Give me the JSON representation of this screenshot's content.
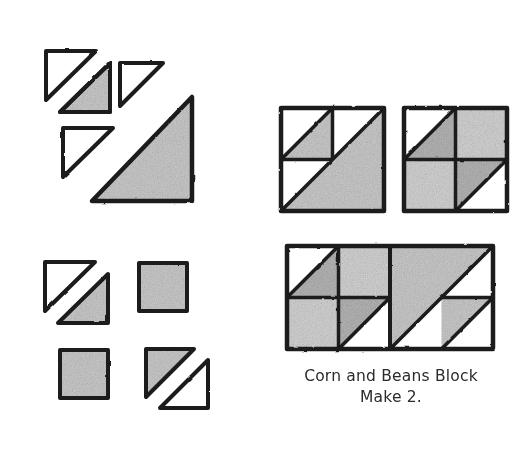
{
  "page": {
    "background_color": "#ffffff",
    "width": 523,
    "height": 449
  },
  "colors": {
    "ink": "#1a1a1a",
    "fabric_light": "#ffffff",
    "fabric_medium": "#c9c9c9",
    "fabric_dark": "#b4b4b4",
    "caption_text": "#2b2b2b"
  },
  "caption": {
    "line1": "Corn and Beans Block",
    "line2": "Make 2."
  },
  "groups": [
    {
      "name": "cutting-group-large-triangles",
      "label": "",
      "pieces": [
        {
          "name": "white-triangle-small-1",
          "fill": "light",
          "orientation": "top-left"
        },
        {
          "name": "gray-triangle-small-1",
          "fill": "medium",
          "orientation": "bottom-right"
        },
        {
          "name": "white-triangle-small-2",
          "fill": "light",
          "orientation": "top-left"
        },
        {
          "name": "white-triangle-small-3",
          "fill": "light",
          "orientation": "top-left"
        },
        {
          "name": "gray-triangle-large-1",
          "fill": "medium",
          "orientation": "bottom-right"
        }
      ]
    },
    {
      "name": "cutting-group-units",
      "label": "",
      "pieces": [
        {
          "name": "hst-unit-white-gray",
          "fill": "mixed",
          "orientation": "top-left-white"
        },
        {
          "name": "square-unit-gray-1",
          "fill": "medium",
          "orientation": "square"
        },
        {
          "name": "square-unit-gray-2",
          "fill": "medium",
          "orientation": "square"
        },
        {
          "name": "hst-unit-gray-white",
          "fill": "mixed",
          "orientation": "top-left-gray"
        }
      ]
    }
  ],
  "assemblies": [
    {
      "name": "half-block-a",
      "description": "Quarter block with small half-square-triangle and large half-square-triangle",
      "quadrants": [
        {
          "name": "quadrant-top-left",
          "type": "hst",
          "light": "white",
          "dark": "gray"
        },
        {
          "name": "quadrant-large-hst",
          "type": "large-hst",
          "light": "white",
          "dark": "gray"
        }
      ]
    },
    {
      "name": "half-block-b",
      "description": "Four patch: hst, square, square, hst",
      "quadrants": [
        {
          "name": "quadrant-top-left",
          "type": "hst",
          "light": "white",
          "dark": "gray"
        },
        {
          "name": "quadrant-top-right",
          "type": "square",
          "light": "gray",
          "dark": "gray"
        },
        {
          "name": "quadrant-bottom-left",
          "type": "square",
          "light": "gray",
          "dark": "gray"
        },
        {
          "name": "quadrant-bottom-right",
          "type": "hst",
          "light": "white",
          "dark": "gray"
        }
      ]
    },
    {
      "name": "full-block",
      "description": "Completed Corn and Beans block: four patch joined with large half-square-triangle unit",
      "quadrants": [
        {
          "name": "quadrant-top-left",
          "type": "hst",
          "light": "white",
          "dark": "gray"
        },
        {
          "name": "quadrant-top-right",
          "type": "square",
          "light": "gray",
          "dark": "gray"
        },
        {
          "name": "quadrant-bottom-left",
          "type": "square",
          "light": "gray",
          "dark": "gray"
        },
        {
          "name": "quadrant-bottom-center",
          "type": "hst",
          "light": "white",
          "dark": "gray"
        },
        {
          "name": "quadrant-large-hst",
          "type": "large-hst",
          "light": "white",
          "dark": "gray"
        },
        {
          "name": "quadrant-bottom-right",
          "type": "hst",
          "light": "white",
          "dark": "gray"
        }
      ]
    }
  ]
}
